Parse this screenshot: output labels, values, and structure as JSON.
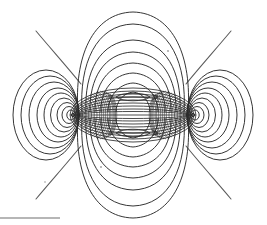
{
  "figure": {
    "background_color": "#ffffff",
    "ink_color": "#2b2b2b",
    "ink_soft_color": "#5a5a5a",
    "ink_faint_color": "#8a8a8a",
    "canvas": {
      "width": 267,
      "height": 225
    }
  },
  "chart_data": {
    "type": "line",
    "xlabel": "",
    "ylabel": "",
    "grid": false,
    "legend_position": "none",
    "xlim": [
      0,
      267
    ],
    "ylim": [
      0,
      225
    ],
    "axis_y": 115,
    "center_x": 133,
    "poles": [
      {
        "name": "left-pole",
        "x": 73,
        "y": 115
      },
      {
        "name": "right-pole",
        "x": 193,
        "y": 115
      }
    ],
    "series": [
      {
        "name": "central-equipotential-ellipses",
        "note": "Confocal ellipses sharing the two poles as foci, drawn through the inter-pole region",
        "count": 34,
        "outer_semi_major": 63,
        "outer_semi_minor": 27
      },
      {
        "name": "left-lobe-field-lines",
        "note": "Nested closed loops encircling the left pole",
        "count": 9,
        "outer_width": 66,
        "outer_height": 90
      },
      {
        "name": "right-lobe-field-lines",
        "note": "Nested closed loops encircling the right pole",
        "count": 9,
        "outer_width": 66,
        "outer_height": 90
      },
      {
        "name": "upper-arch-field-lines",
        "note": "Nested arches spanning pole to pole above the axis",
        "count": 8,
        "outer_apex_y": 12
      },
      {
        "name": "lower-arch-field-lines",
        "note": "Nested arches spanning pole to pole below the axis",
        "count": 8,
        "outer_apex_y": 218
      },
      {
        "name": "escaping-diagonal-lines",
        "note": "Four open field lines running to the image corners",
        "count": 4
      }
    ],
    "annotations": [
      {
        "name": "upper-axis-arrow",
        "x": 133,
        "y": 97,
        "direction": "right"
      },
      {
        "name": "lower-axis-arrow",
        "x": 133,
        "y": 133,
        "direction": "right"
      },
      {
        "name": "upper-axis-lens",
        "x": 133,
        "y": 97
      },
      {
        "name": "lower-axis-lens",
        "x": 133,
        "y": 133
      }
    ]
  },
  "artifacts": {
    "scan_bar": {
      "label": "scanner edge artifact",
      "color": "#9a9a9a",
      "x": 0,
      "y": 217,
      "width": 60,
      "height": 2
    }
  }
}
